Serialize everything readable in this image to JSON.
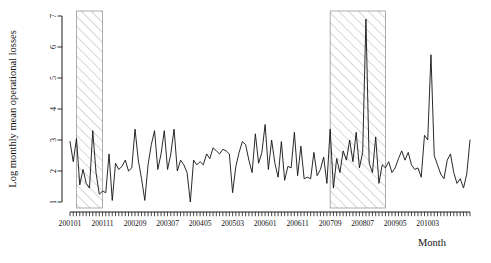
{
  "chart_data": {
    "type": "line",
    "title": "",
    "xlabel": "Month",
    "ylabel": "Log monthly mean operational losses",
    "ylim": [
      0.7,
      7.2
    ],
    "yticks": [
      1,
      2,
      3,
      4,
      5,
      6,
      7
    ],
    "ytick_labels": [
      "1",
      "2",
      "3",
      "4",
      "5",
      "6",
      "7"
    ],
    "grid": false,
    "legend": "none",
    "x_start_label": "200101",
    "xtick_labels": [
      "200101",
      "200111",
      "200209",
      "200307",
      "200405",
      "200503",
      "200601",
      "200611",
      "200709",
      "200807",
      "200905",
      "201003"
    ],
    "xtick_indices": [
      0,
      10,
      20,
      30,
      40,
      50,
      60,
      70,
      80,
      90,
      100,
      110
    ],
    "n_points": 124,
    "shaded_regions": [
      {
        "name": "recession-band-1",
        "start_index": 2,
        "end_index": 10,
        "start_label": "200103",
        "end_label": "200111",
        "hatch": "diagonal",
        "fill": "#ffffff",
        "stroke": "#8a8a8a"
      },
      {
        "name": "recession-band-2",
        "start_index": 80,
        "end_index": 97,
        "start_label": "200709",
        "end_label": "200902",
        "hatch": "diagonal",
        "fill": "#ffffff",
        "stroke": "#8a8a8a"
      }
    ],
    "values": [
      2.95,
      2.3,
      3.05,
      1.55,
      2.05,
      1.6,
      1.45,
      3.3,
      1.95,
      1.25,
      1.35,
      1.3,
      2.55,
      1.05,
      2.25,
      2.05,
      2.15,
      2.35,
      2.0,
      2.1,
      3.35,
      2.35,
      1.75,
      1.05,
      2.2,
      2.85,
      3.3,
      2.05,
      2.55,
      3.3,
      2.05,
      2.55,
      3.35,
      2.0,
      2.35,
      2.2,
      1.95,
      1.0,
      2.35,
      2.2,
      2.3,
      2.2,
      2.55,
      2.4,
      2.75,
      2.65,
      2.55,
      2.7,
      2.65,
      2.55,
      1.3,
      2.15,
      2.6,
      2.95,
      2.85,
      2.35,
      1.95,
      3.2,
      2.25,
      2.6,
      3.5,
      2.05,
      3.0,
      2.25,
      1.8,
      2.95,
      1.7,
      2.15,
      2.1,
      3.25,
      1.85,
      2.8,
      1.75,
      1.8,
      1.75,
      2.6,
      1.85,
      2.05,
      2.45,
      1.6,
      3.35,
      1.45,
      2.4,
      1.95,
      2.65,
      2.35,
      3.0,
      2.3,
      3.25,
      2.1,
      2.6,
      6.9,
      2.25,
      1.95,
      3.1,
      1.6,
      2.2,
      2.1,
      2.3,
      1.95,
      2.1,
      2.4,
      2.65,
      2.35,
      2.6,
      2.2,
      2.05,
      2.1,
      1.8,
      3.15,
      3.0,
      5.75,
      2.5,
      2.2,
      1.9,
      1.75,
      2.35,
      2.55,
      1.95,
      1.6,
      1.75,
      1.45,
      1.9,
      3.0
    ]
  }
}
